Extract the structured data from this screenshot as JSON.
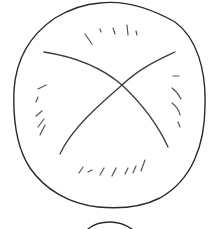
{
  "drawing": {
    "description": "Hand-drawn line sketch of a round object with a crossed X and short hatch marks, with a second partial arc below",
    "canvas": {
      "width": 213,
      "height": 229,
      "background": "#ffffff"
    },
    "colors": {
      "outline": "#2a2a2a",
      "cross": "#3a3a3a",
      "hatch": "#555555"
    },
    "outline_circle": {
      "cx": 109,
      "cy": 105,
      "rx": 95,
      "ry": 102
    },
    "cross_lines": [
      {
        "name": "cross-line-a",
        "from": [
          44,
          52
        ],
        "via": [
          122,
          85
        ],
        "to": [
          168,
          147
        ]
      },
      {
        "name": "cross-line-b",
        "from": [
          175,
          52
        ],
        "via": [
          122,
          85
        ],
        "to": [
          60,
          154
        ]
      }
    ],
    "hatch_groups": [
      {
        "name": "top-hatches",
        "count": 5
      },
      {
        "name": "left-hatches",
        "count": 5
      },
      {
        "name": "right-hatches",
        "count": 4
      },
      {
        "name": "bottom-hatches",
        "count": 7
      }
    ],
    "lower_partial_arc": {
      "from": [
        88,
        229
      ],
      "peak": [
        108,
        222
      ],
      "to": [
        132,
        229
      ]
    }
  }
}
